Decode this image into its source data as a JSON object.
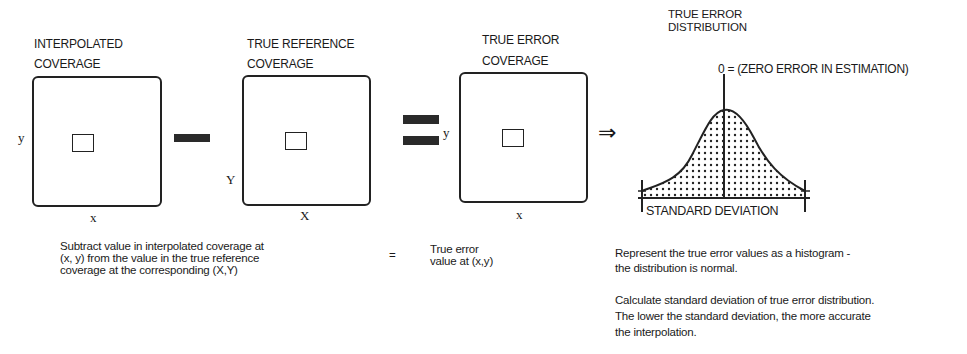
{
  "panels": [
    {
      "title_line1": "INTERPOLATED",
      "title_line2": "COVERAGE",
      "axis_y": "y",
      "axis_x": "x"
    },
    {
      "title_line1": "TRUE REFERENCE",
      "title_line2": "COVERAGE",
      "axis_y": "Y",
      "axis_x": "X"
    },
    {
      "title_line1": "TRUE ERROR",
      "title_line2": "COVERAGE",
      "axis_y": "y",
      "axis_x": "x"
    }
  ],
  "operators": {
    "minus": "minus",
    "equals": "equals",
    "implies": "⇒"
  },
  "distribution": {
    "title_line1": "TRUE ERROR",
    "title_line2": "DISTRIBUTION",
    "zero_label": "0 = (ZERO ERROR IN ESTIMATION)",
    "std_label": "STANDARD DEVIATION"
  },
  "descriptions": {
    "subtract_line1": "Subtract value in interpolated coverage at",
    "subtract_line2": "(x, y) from the value in the true reference",
    "subtract_line3": "coverage at the corresponding (X,Y)",
    "equals_sign": "=",
    "result_line1": "True error",
    "result_line2": "value at (x,y)",
    "histogram_line1": "Represent the true error values as a histogram -",
    "histogram_line2": "the distribution is normal.",
    "stddev_line1": "Calculate standard deviation of true error distribution.",
    "stddev_line2": "The lower the standard deviation, the  more accurate",
    "stddev_line3": "the interpolation."
  }
}
